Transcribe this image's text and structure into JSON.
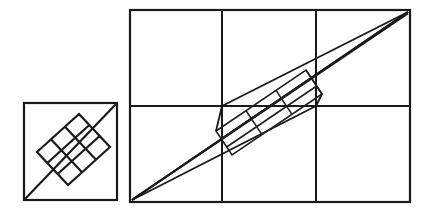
{
  "figure": {
    "description": "Two line-drawn figures: a square containing a tilted three-by-three grid square on its diagonal, and a three-by-two rectangle of squares containing an elongated tilted grid parallelogram along its diagonal.",
    "background_color": "#ffffff",
    "ink_color": "#1a1a1a"
  },
  "left_figure": {
    "name": "square-with-tilted-grid",
    "outer_square": {
      "x": 24,
      "y": 103,
      "width": 93,
      "height": 97,
      "stroke_width": 2.2
    },
    "diagonal": {
      "x1": 26,
      "y1": 198,
      "x2": 115,
      "y2": 105,
      "stroke_width": 2.2
    },
    "tilted_grid": {
      "rows": 3,
      "columns": 3,
      "cells": 9,
      "corners": [
        [
          37,
          152
        ],
        [
          79,
          114
        ],
        [
          110,
          147
        ],
        [
          68,
          185
        ]
      ],
      "stroke_width": 2.2
    }
  },
  "right_figure": {
    "name": "rectangle-with-tilted-sliver-grid",
    "outer_rectangle": {
      "x": 130,
      "y": 10,
      "width": 280,
      "height": 192,
      "stroke_width": 2.2
    },
    "grid": {
      "columns": 3,
      "rows": 2,
      "vertical_lines_x": [
        222,
        316
      ],
      "horizontal_lines_y": [
        106
      ],
      "stroke_width": 2.0
    },
    "main_diagonal": {
      "x1": 132,
      "y1": 200,
      "x2": 408,
      "y2": 12,
      "stroke_width": 2.0
    },
    "corner_rays": [
      {
        "name": "lower-ray-from-bottom-left",
        "x1": 132,
        "y1": 200,
        "x2": 408,
        "y2": 12
      },
      {
        "name": "ray-bottom-left-to-mid-junction",
        "x1": 132,
        "y1": 200,
        "x2": 316,
        "y2": 106
      },
      {
        "name": "ray-top-right-to-left-junction",
        "x1": 408,
        "y1": 12,
        "x2": 222,
        "y2": 106
      },
      {
        "name": "ray-top-right-to-bottom-left-steep",
        "x1": 408,
        "y1": 12,
        "x2": 132,
        "y2": 200
      }
    ],
    "sliver_parallelogram": {
      "rows": 3,
      "columns": 3,
      "cells": 9,
      "corners": [
        [
          216,
          131
        ],
        [
          306,
          70
        ],
        [
          322,
          94
        ],
        [
          232,
          155
        ]
      ],
      "stroke_width": 1.6
    }
  }
}
